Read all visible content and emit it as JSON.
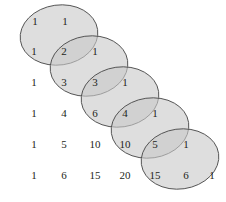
{
  "figure": {
    "type": "diagram",
    "background_color": "#ffffff",
    "number_color": "#231f20",
    "ellipse_fill": "#c9c9c9",
    "ellipse_stroke": "#4d4d4d",
    "ellipse_opacity": 0.62
  },
  "chart_data": {
    "type": "table",
    "title": "",
    "rows": [
      [
        "1",
        "1"
      ],
      [
        "1",
        "2",
        "1"
      ],
      [
        "1",
        "3",
        "3",
        "1"
      ],
      [
        "1",
        "4",
        "6",
        "4",
        "1"
      ],
      [
        "1",
        "5",
        "10",
        "10",
        "5",
        "1"
      ],
      [
        "1",
        "6",
        "15",
        "20",
        "15",
        "6",
        "1"
      ]
    ]
  },
  "numbers": [
    {
      "text": "1",
      "x": 35,
      "y": 21,
      "row": 0,
      "col": 0
    },
    {
      "text": "1",
      "x": 65,
      "y": 21,
      "row": 0,
      "col": 1
    },
    {
      "text": "1",
      "x": 34,
      "y": 51,
      "row": 1,
      "col": 0
    },
    {
      "text": "2",
      "x": 64,
      "y": 51,
      "row": 1,
      "col": 1
    },
    {
      "text": "1",
      "x": 95,
      "y": 51,
      "row": 1,
      "col": 2
    },
    {
      "text": "1",
      "x": 34,
      "y": 82,
      "row": 2,
      "col": 0
    },
    {
      "text": "3",
      "x": 64,
      "y": 82,
      "row": 2,
      "col": 1
    },
    {
      "text": "3",
      "x": 95,
      "y": 82,
      "row": 2,
      "col": 2
    },
    {
      "text": "1",
      "x": 125,
      "y": 82,
      "row": 2,
      "col": 3
    },
    {
      "text": "1",
      "x": 34,
      "y": 113,
      "row": 3,
      "col": 0
    },
    {
      "text": "4",
      "x": 64,
      "y": 113,
      "row": 3,
      "col": 1
    },
    {
      "text": "6",
      "x": 95,
      "y": 113,
      "row": 3,
      "col": 2
    },
    {
      "text": "4",
      "x": 125,
      "y": 113,
      "row": 3,
      "col": 3
    },
    {
      "text": "1",
      "x": 155,
      "y": 113,
      "row": 3,
      "col": 4
    },
    {
      "text": "1",
      "x": 34,
      "y": 144,
      "row": 4,
      "col": 0
    },
    {
      "text": "5",
      "x": 64,
      "y": 144,
      "row": 4,
      "col": 1
    },
    {
      "text": "10",
      "x": 95,
      "y": 144,
      "row": 4,
      "col": 2
    },
    {
      "text": "10",
      "x": 125,
      "y": 144,
      "row": 4,
      "col": 3
    },
    {
      "text": "5",
      "x": 155,
      "y": 144,
      "row": 4,
      "col": 4
    },
    {
      "text": "1",
      "x": 186,
      "y": 144,
      "row": 4,
      "col": 5
    },
    {
      "text": "1",
      "x": 34,
      "y": 175,
      "row": 5,
      "col": 0
    },
    {
      "text": "6",
      "x": 64,
      "y": 175,
      "row": 5,
      "col": 1
    },
    {
      "text": "15",
      "x": 95,
      "y": 175,
      "row": 5,
      "col": 2
    },
    {
      "text": "20",
      "x": 125,
      "y": 175,
      "row": 5,
      "col": 3
    },
    {
      "text": "15",
      "x": 155,
      "y": 175,
      "row": 5,
      "col": 4
    },
    {
      "text": "6",
      "x": 186,
      "y": 175,
      "row": 5,
      "col": 5
    },
    {
      "text": "1",
      "x": 212,
      "y": 175,
      "row": 5,
      "col": 6
    }
  ],
  "ellipses": [
    {
      "cx": 59,
      "cy": 35,
      "rx": 39,
      "ry": 30,
      "rotate": -8,
      "covers": "1-1-2"
    },
    {
      "cx": 89,
      "cy": 66,
      "rx": 39,
      "ry": 30,
      "rotate": -8,
      "covers": "2-1-3"
    },
    {
      "cx": 120,
      "cy": 97,
      "rx": 39,
      "ry": 30,
      "rotate": -8,
      "covers": "3-1-4"
    },
    {
      "cx": 150,
      "cy": 128,
      "rx": 39,
      "ry": 30,
      "rotate": -8,
      "covers": "4-1-5"
    },
    {
      "cx": 180,
      "cy": 159,
      "rx": 39,
      "ry": 30,
      "rotate": -8,
      "covers": "5-1-6"
    }
  ]
}
